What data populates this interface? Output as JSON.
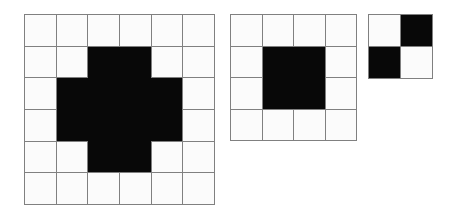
{
  "figure": {
    "type": "binary-grid-diagram",
    "background_color": "#ffffff",
    "cell_on_color": "#080808",
    "cell_off_color": "#fbfbfb",
    "grid_line_color": "#808080",
    "grid_line_width_px": 1,
    "panel_count": 3,
    "panels": [
      {
        "name": "plus-shape-grid",
        "rows": 6,
        "cols": 6,
        "cell_size_px": 30.7,
        "left_px": 24,
        "top_px": 14,
        "shape_label": "plus",
        "filled_count": 12,
        "matrix": [
          [
            0,
            0,
            0,
            0,
            0,
            0
          ],
          [
            0,
            0,
            1,
            1,
            0,
            0
          ],
          [
            0,
            1,
            1,
            1,
            1,
            0
          ],
          [
            0,
            1,
            1,
            1,
            1,
            0
          ],
          [
            0,
            0,
            1,
            1,
            0,
            0
          ],
          [
            0,
            0,
            0,
            0,
            0,
            0
          ]
        ]
      },
      {
        "name": "square-block-grid",
        "rows": 4,
        "cols": 4,
        "cell_size_px": 30.5,
        "left_px": 230,
        "top_px": 14,
        "shape_label": "square",
        "filled_count": 4,
        "matrix": [
          [
            0,
            0,
            0,
            0
          ],
          [
            0,
            1,
            1,
            0
          ],
          [
            0,
            1,
            1,
            0
          ],
          [
            0,
            0,
            0,
            0
          ]
        ]
      },
      {
        "name": "checkerboard-grid",
        "rows": 2,
        "cols": 2,
        "cell_size_px": 31,
        "left_px": 368,
        "top_px": 14,
        "shape_label": "checkerboard",
        "filled_count": 2,
        "matrix": [
          [
            0,
            1
          ],
          [
            1,
            0
          ]
        ]
      }
    ]
  }
}
